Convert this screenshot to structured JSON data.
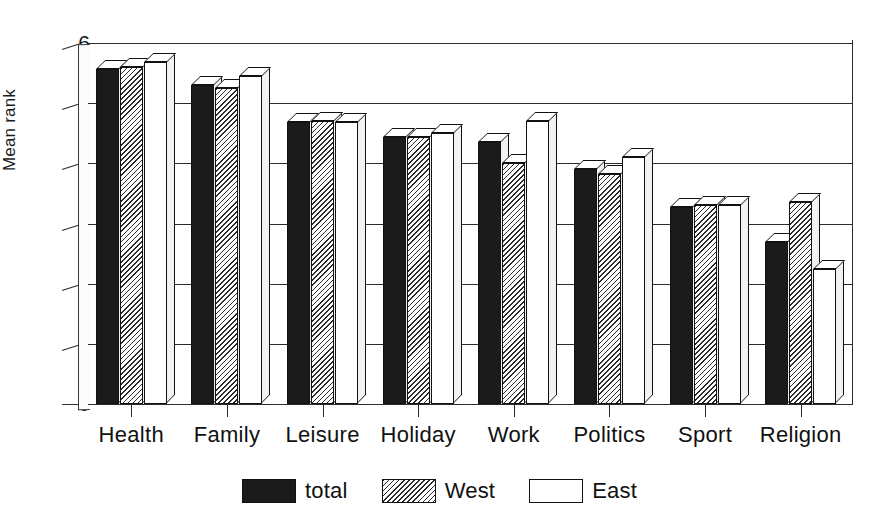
{
  "chart_data": {
    "type": "bar",
    "title": "",
    "xlabel": "",
    "ylabel": "Mean rank",
    "ylim": [
      0,
      6
    ],
    "ytick_labels": [
      "0",
      "1",
      "2",
      "3",
      "4",
      "5",
      "6"
    ],
    "ytick_values": [
      0,
      1,
      2,
      3,
      4,
      5,
      6
    ],
    "grid": true,
    "legend_position": "bottom-center",
    "categories": [
      "Health",
      "Family",
      "Leisure",
      "Holiday",
      "Work",
      "Politics",
      "Sport",
      "Religion"
    ],
    "series": [
      {
        "name": "total",
        "fill": "solid-black",
        "color": "#1b1b1b",
        "values": [
          5.57,
          5.3,
          4.68,
          4.43,
          4.35,
          3.9,
          3.28,
          2.7
        ]
      },
      {
        "name": "West",
        "fill": "diagonal-hatch",
        "color": "#2a2a2a",
        "values": [
          5.6,
          5.25,
          4.7,
          4.43,
          4.0,
          3.82,
          3.3,
          3.35
        ]
      },
      {
        "name": "East",
        "fill": "white",
        "color": "#ffffff",
        "values": [
          5.68,
          5.45,
          4.68,
          4.5,
          4.7,
          4.1,
          3.3,
          2.25
        ]
      }
    ]
  },
  "legend": {
    "items": [
      {
        "label": "total",
        "swatch": "solid-black-swatch"
      },
      {
        "label": "West",
        "swatch": "hatched-swatch"
      },
      {
        "label": "East",
        "swatch": "white-swatch"
      }
    ]
  },
  "axes": {
    "y_title": "Mean rank"
  }
}
